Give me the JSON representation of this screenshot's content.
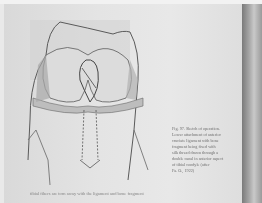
{
  "photo": {
    "subject": "book page with anatomical sketch of knee joint",
    "colors": {
      "page": "#e4e4e4",
      "ink": "#5a5a5a",
      "edge_shadow": "#7a7a7a"
    }
  },
  "caption": {
    "lines": [
      "Fig. 97. Sketch of operation.",
      "Lower attachment of anterior",
      "cruciate ligament with bone",
      "fragment being fixed with",
      "silk thread drawn through a",
      "double canal in anterior aspect",
      "of tibial condyle (after",
      "Fa. O., 1922)"
    ]
  },
  "bottom_text": "tibial fibers are torn away with the ligament and bone fragment"
}
